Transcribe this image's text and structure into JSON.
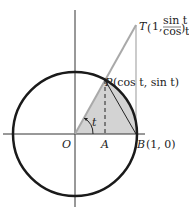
{
  "diagram": {
    "colors": {
      "circle": "#1a1a1a",
      "axes": "#333333",
      "shade": "#d3d3d3",
      "tangent": "#a9a9a9"
    },
    "points": {
      "O": {
        "label": "O"
      },
      "A": {
        "label": "A"
      },
      "B": {
        "label": "B",
        "coords": "(1, 0)"
      },
      "P": {
        "label": "P",
        "coords": "(cos t, sin t)"
      },
      "T": {
        "label": "T",
        "coords_prefix": "1,",
        "num": "sin t",
        "den": "cos t"
      }
    },
    "angle_label": "t"
  }
}
